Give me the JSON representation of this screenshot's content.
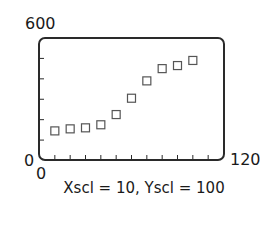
{
  "chart_data": {
    "type": "scatter",
    "title": "",
    "xlabel": "",
    "ylabel": "",
    "xlim": [
      0,
      120
    ],
    "ylim": [
      0,
      600
    ],
    "x_tick_step": 10,
    "y_tick_step": 100,
    "grid": false,
    "marker": "open-square",
    "series": [
      {
        "name": "data",
        "x": [
          10,
          20,
          30,
          40,
          50,
          60,
          70,
          80,
          90,
          100
        ],
        "y": [
          145,
          155,
          160,
          175,
          225,
          305,
          390,
          450,
          465,
          490
        ]
      }
    ],
    "labels": {
      "ymax": "600",
      "ymin": "0",
      "xmin": "0",
      "xmax": "120"
    },
    "caption": "Xscl = 10, Yscl = 100"
  },
  "colors": {
    "frame": "#2a2a2a",
    "marker": "#555555",
    "text": "#1a1a1a"
  }
}
